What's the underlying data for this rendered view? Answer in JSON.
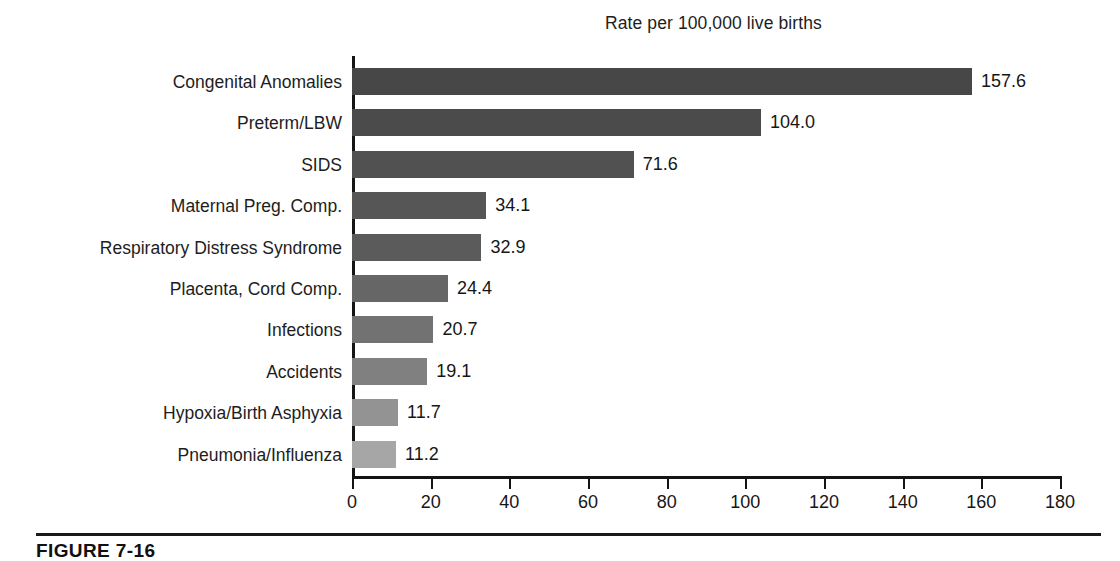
{
  "chart_data": {
    "type": "bar",
    "orientation": "horizontal",
    "title": "Rate per 100,000 live births",
    "xlabel": "",
    "ylabel": "",
    "xlim": [
      0,
      180
    ],
    "xticks": [
      0,
      20,
      40,
      60,
      80,
      100,
      120,
      140,
      160,
      180
    ],
    "xtick_labels": [
      "0",
      "20",
      "40",
      "60",
      "80",
      "100",
      "120",
      "140",
      "160",
      "180"
    ],
    "grid": false,
    "legend": null,
    "categories": [
      "Congenital Anomalies",
      "Preterm/LBW",
      "SIDS",
      "Maternal Preg. Comp.",
      "Respiratory Distress Syndrome",
      "Placenta, Cord Comp.",
      "Infections",
      "Accidents",
      "Hypoxia/Birth Asphyxia",
      "Pneumonia/Influenza"
    ],
    "values": [
      157.6,
      104.0,
      71.6,
      34.1,
      32.9,
      24.4,
      20.7,
      19.1,
      11.7,
      11.2
    ],
    "value_labels": [
      "157.6",
      "104.0",
      "71.6",
      "34.1",
      "32.9",
      "24.4",
      "20.7",
      "19.1",
      "11.7",
      "11.2"
    ],
    "bar_colors": [
      "#474747",
      "#4b4b4b",
      "#515151",
      "#565656",
      "#5b5b5b",
      "#666666",
      "#727272",
      "#808080",
      "#939393",
      "#a6a6a6"
    ]
  },
  "caption": {
    "figure_number": "FIGURE 7-16"
  }
}
